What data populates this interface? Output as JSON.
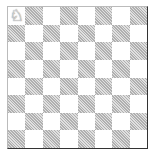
{
  "board": {
    "size": 8,
    "light_color": "#ffffff",
    "dark_color": "#c8c8c8",
    "top_left_is_light": true,
    "pieces": [
      {
        "square": "a8",
        "row": 0,
        "col": 0,
        "piece": "white-knight",
        "glyph": "♘"
      }
    ]
  }
}
